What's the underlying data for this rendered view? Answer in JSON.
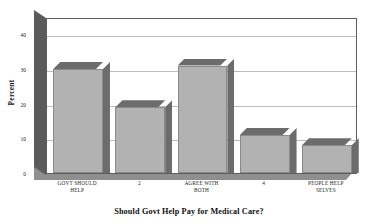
{
  "chart_data": {
    "type": "bar",
    "title": "",
    "subtitle": "",
    "xlabel": "Should Govt Help Pay for Medical Care?",
    "ylabel": "Percent",
    "categories": [
      "GOVT SHOULD HELP",
      "2",
      "AGREE WITH BOTH",
      "4",
      "PEOPLE HELP SELVES"
    ],
    "category_lines": [
      [
        "GOVT SHOULD",
        "HELP"
      ],
      [
        "2",
        ""
      ],
      [
        "AGREE WITH",
        "BOTH"
      ],
      [
        "4",
        ""
      ],
      [
        "PEOPLE HELP",
        "SELVES"
      ]
    ],
    "values": [
      30,
      19,
      31,
      11,
      8
    ],
    "ylim": [
      0,
      45
    ],
    "yticks": [
      "0",
      "10",
      "20",
      "30",
      "40"
    ],
    "ytick_values": [
      0,
      10,
      20,
      30,
      40
    ],
    "grid": true,
    "legend": false,
    "style": "3d-bar",
    "colors": {
      "bar_face": "#b2b2b2",
      "bar_shade": "#6c6c6c",
      "wall": "#5b5b5b",
      "floor": "#8f8f8f",
      "gridline": "#bdbdbd",
      "frame": "#5d5d5d",
      "text": "#1a1a1a",
      "background": "#ffffff"
    }
  }
}
